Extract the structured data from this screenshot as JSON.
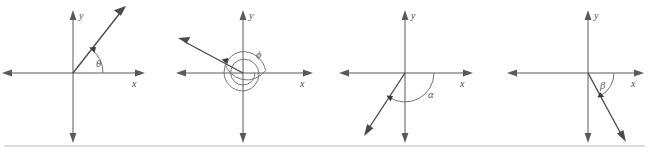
{
  "figure": {
    "background_color": "#ffffff",
    "line_color": "#5a5a5a",
    "ray_color": "#4a4a4a",
    "arc_color": "#6a6a6a",
    "label_color": "#4d4d4d",
    "rule_color": "#b9b9b9",
    "width": 649,
    "height": 157
  },
  "diagrams": [
    {
      "id": "diagram-theta",
      "angle_label": "θ",
      "x_axis_label": "x",
      "y_axis_label": "y",
      "origin": {
        "x": 73,
        "y": 73
      },
      "terminal_ray_deg": 52,
      "ray_length": 76,
      "rotation_direction": "counterclockwise",
      "quadrant": "I",
      "arc_radius": 30,
      "arc_start_deg": 0,
      "arc_end_deg": 52,
      "label_pos": {
        "x": 96,
        "y": 67
      },
      "spiral": false
    },
    {
      "id": "diagram-phi",
      "angle_label": "ϕ",
      "x_axis_label": "x",
      "y_axis_label": "y",
      "origin": {
        "x": 243,
        "y": 73
      },
      "terminal_ray_deg": 157,
      "ray_length": 72,
      "rotation_direction": "counterclockwise",
      "quadrant": "II",
      "arc_radius": 22,
      "arc_start_deg": 0,
      "arc_end_deg": 517,
      "label_pos": {
        "x": 256,
        "y": 58
      },
      "spiral": true
    },
    {
      "id": "diagram-alpha",
      "angle_label": "α",
      "x_axis_label": "x",
      "y_axis_label": "y",
      "origin": {
        "x": 405,
        "y": 73
      },
      "terminal_ray_deg": 237,
      "ray_length": 72,
      "rotation_direction": "clockwise",
      "quadrant": "III",
      "arc_radius": 29,
      "arc_start_deg": 0,
      "arc_end_deg": -123,
      "label_pos": {
        "x": 428,
        "y": 98
      },
      "spiral": false
    },
    {
      "id": "diagram-beta",
      "angle_label": "β",
      "x_axis_label": "x",
      "y_axis_label": "y",
      "origin": {
        "x": 588,
        "y": 73
      },
      "terminal_ray_deg": 298,
      "ray_length": 70,
      "rotation_direction": "clockwise",
      "quadrant": "IV",
      "arc_radius": 26,
      "arc_start_deg": 0,
      "arc_end_deg": -62,
      "label_pos": {
        "x": 600,
        "y": 89
      },
      "spiral": false
    }
  ],
  "bottom_rule": {
    "y": 146,
    "x_start": 4,
    "x_end": 645
  }
}
